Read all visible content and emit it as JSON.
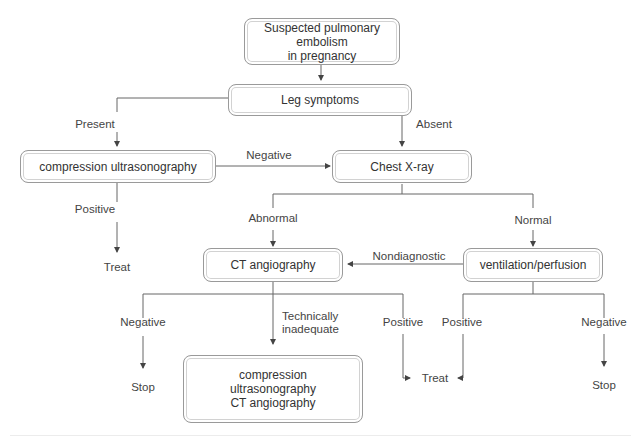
{
  "diagram": {
    "nodes": {
      "start": "Suspected pulmonary embolism\nin pregnancy",
      "leg_symptoms": "Leg symptoms",
      "cus": "compression ultrasonography",
      "chest_xray": "Chest X-ray",
      "ct_angio": "CT angiography",
      "vq": "ventilation/perfusion",
      "cus_ct": "compression\nultrasonography\nCT angiography"
    },
    "edge_labels": {
      "present": "Present",
      "absent": "Absent",
      "negative_cus": "Negative",
      "positive_cus": "Positive",
      "abnormal": "Abnormal",
      "normal": "Normal",
      "nondiagnostic": "Nondiagnostic",
      "negative_ct": "Negative",
      "technically_inadequate": "Technically\ninadequate",
      "positive_ct": "Positive",
      "positive_vq": "Positive",
      "negative_vq": "Negative"
    },
    "outcomes": {
      "treat_cus": "Treat",
      "stop_ct": "Stop",
      "treat_shared": "Treat",
      "stop_vq": "Stop"
    },
    "colors": {
      "line": "#555555",
      "box_border": "#9a9a9a",
      "text": "#333333"
    }
  }
}
